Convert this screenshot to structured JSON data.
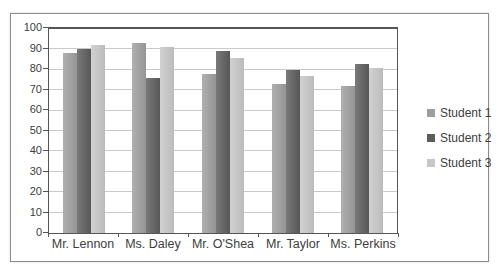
{
  "chart_data": {
    "type": "bar",
    "title": "",
    "categories": [
      "Mr. Lennon",
      "Ms. Daley",
      "Mr. O'Shea",
      "Mr. Taylor",
      "Ms. Perkins"
    ],
    "series": [
      {
        "name": "Student 1",
        "color": "#9e9e9e",
        "values": [
          88,
          93,
          78,
          73,
          72
        ]
      },
      {
        "name": "Student 2",
        "color": "#5c5c5c",
        "values": [
          90,
          76,
          89,
          80,
          83
        ]
      },
      {
        "name": "Student 3",
        "color": "#c7c7c7",
        "values": [
          92,
          91,
          86,
          77,
          81
        ]
      }
    ],
    "xlabel": "",
    "ylabel": "",
    "ylim": [
      0,
      100
    ],
    "yticks": [
      0,
      10,
      20,
      30,
      40,
      50,
      60,
      70,
      80,
      90,
      100
    ],
    "grid": "horizontal",
    "legend_position": "right",
    "colors": {
      "gridline": "#c9c9c9",
      "axis": "#555555",
      "frame_border": "#8c8c8c",
      "text": "#3d3d3d",
      "background": "#ffffff"
    }
  }
}
